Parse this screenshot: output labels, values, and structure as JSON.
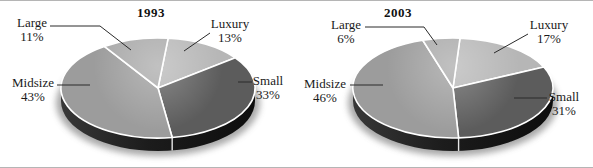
{
  "figure": {
    "background": "#ffffff",
    "rule_color": "#b5b5b5",
    "label_text_color": "#1a1a1a",
    "divider_color": "#ffffff",
    "rim_color": "#1c1c1c"
  },
  "chart_data": [
    {
      "type": "pie",
      "style": "3d",
      "title": "1993",
      "legend_position": "callout-labels",
      "slices": [
        {
          "label": "Luxury",
          "value": 13,
          "display": "13%",
          "color": "#b6b6b6"
        },
        {
          "label": "Small",
          "value": 33,
          "display": "33%",
          "color": "#5c5c5c"
        },
        {
          "label": "Midsize",
          "value": 43,
          "display": "43%",
          "color": "#9c9c9c"
        },
        {
          "label": "Large",
          "value": 11,
          "display": "11%",
          "color": "#a9a9a9"
        }
      ]
    },
    {
      "type": "pie",
      "style": "3d",
      "title": "2003",
      "legend_position": "callout-labels",
      "slices": [
        {
          "label": "Luxury",
          "value": 17,
          "display": "17%",
          "color": "#b6b6b6"
        },
        {
          "label": "Small",
          "value": 31,
          "display": "31%",
          "color": "#5c5c5c"
        },
        {
          "label": "Midsize",
          "value": 46,
          "display": "46%",
          "color": "#9c9c9c"
        },
        {
          "label": "Large",
          "value": 6,
          "display": "6%",
          "color": "#a9a9a9"
        }
      ]
    }
  ]
}
